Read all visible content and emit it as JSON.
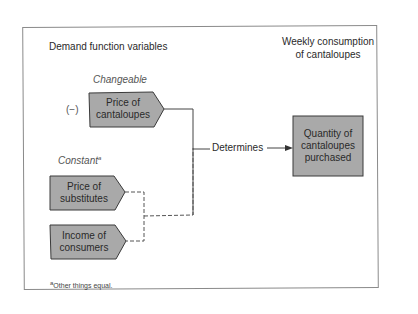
{
  "diagram": {
    "left_heading": "Demand function variables",
    "right_heading_line1": "Weekly consumption",
    "right_heading_line2": "of cantaloupes",
    "changeable_label": "Changeable",
    "constant_label": "Constant",
    "constant_superscript": "a",
    "sign_label": "(−)",
    "connector_label": "Determines",
    "nodes": [
      {
        "id": "price-of-cantaloupes",
        "line1": "Price of",
        "line2": "cantaloupes",
        "group": "changeable"
      },
      {
        "id": "price-of-substitutes",
        "line1": "Price of",
        "line2": "substitutes",
        "group": "constant"
      },
      {
        "id": "income-of-consumers",
        "line1": "Income of",
        "line2": "consumers",
        "group": "constant"
      }
    ],
    "output_node": {
      "line1": "Quantity of",
      "line2": "cantaloupes",
      "line3": "purchased"
    },
    "footnote_marker": "a",
    "footnote_text": "Other things equal.",
    "colors": {
      "box_fill": "#a9a9a9",
      "box_stroke": "#3a3a3a",
      "line": "#444444",
      "frame": "#8a8a8a"
    }
  }
}
